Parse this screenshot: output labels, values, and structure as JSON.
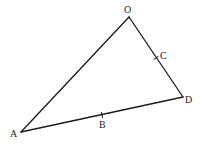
{
  "diagram": {
    "type": "geometry-triangle",
    "points": {
      "O": {
        "label": "O",
        "x": 129,
        "y": 17,
        "label_x": 124,
        "label_y": 13
      },
      "A": {
        "label": "A",
        "x": 21,
        "y": 132,
        "label_x": 10,
        "label_y": 137
      },
      "D": {
        "label": "D",
        "x": 183,
        "y": 97,
        "label_x": 185,
        "label_y": 103
      },
      "C": {
        "label": "C",
        "x": 156,
        "y": 58,
        "label_x": 160,
        "label_y": 59
      },
      "B": {
        "label": "B",
        "x": 102,
        "y": 115,
        "label_x": 99,
        "label_y": 128
      }
    },
    "edges": [
      {
        "from": "A",
        "to": "O"
      },
      {
        "from": "O",
        "to": "D"
      },
      {
        "from": "A",
        "to": "D"
      }
    ],
    "ticks": [
      {
        "on": "OD",
        "at": "C"
      },
      {
        "on": "AD",
        "at": "B"
      }
    ],
    "colors": {
      "line": "#1a1a1a",
      "label": "#222222",
      "background": "#ffffff"
    }
  }
}
